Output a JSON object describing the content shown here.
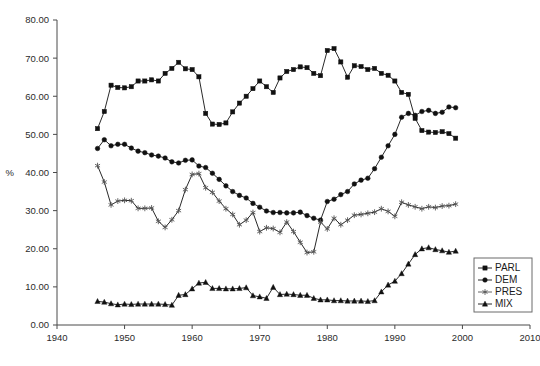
{
  "chart_data": {
    "type": "line",
    "title": "",
    "xlabel": "",
    "ylabel": "%",
    "xlim": [
      1940,
      2010
    ],
    "ylim": [
      0,
      80
    ],
    "xticks": [
      1940,
      1950,
      1960,
      1970,
      1980,
      1990,
      2000,
      2010
    ],
    "xtick_labels": [
      "1940",
      "1950",
      "1960",
      "1970",
      "1980",
      "1990",
      "2000",
      "2010"
    ],
    "yticks": [
      0,
      10,
      20,
      30,
      40,
      50,
      60,
      70,
      80
    ],
    "ytick_labels": [
      "0.00",
      "10.00",
      "20.00",
      "30.00",
      "40.00",
      "50.00",
      "60.00",
      "70.00",
      "80.00"
    ],
    "grid": false,
    "legend_position": "right-middle",
    "x": [
      1946,
      1947,
      1948,
      1949,
      1950,
      1951,
      1952,
      1953,
      1954,
      1955,
      1956,
      1957,
      1958,
      1959,
      1960,
      1961,
      1962,
      1963,
      1964,
      1965,
      1966,
      1967,
      1968,
      1969,
      1970,
      1971,
      1972,
      1973,
      1974,
      1975,
      1976,
      1977,
      1978,
      1979,
      1980,
      1981,
      1982,
      1983,
      1984,
      1985,
      1986,
      1987,
      1988,
      1989,
      1990,
      1991,
      1992,
      1993,
      1994,
      1995,
      1996,
      1997,
      1998,
      1999
    ],
    "series": [
      {
        "name": "PARL",
        "marker": "square",
        "color": "#111111",
        "values": [
          51.5,
          56.0,
          62.9,
          62.3,
          62.2,
          62.5,
          64.0,
          64.0,
          64.3,
          64.0,
          66.0,
          67.3,
          68.9,
          67.2,
          67.0,
          65.1,
          55.5,
          52.7,
          52.6,
          53.0,
          55.9,
          58.2,
          60.0,
          62.0,
          64.0,
          62.5,
          61.0,
          64.8,
          66.5,
          67.0,
          67.7,
          67.5,
          66.0,
          65.4,
          72.0,
          72.5,
          69.0,
          65.0,
          68.0,
          67.8,
          67.0,
          67.3,
          66.0,
          65.5,
          64.0,
          61.0,
          60.5,
          54.2,
          51.0,
          50.6,
          50.5,
          50.7,
          50.2,
          49.0
        ]
      },
      {
        "name": "DEM",
        "marker": "circle",
        "color": "#111111",
        "values": [
          46.3,
          48.6,
          47.0,
          47.4,
          47.4,
          46.4,
          45.6,
          45.2,
          44.6,
          44.3,
          43.8,
          42.8,
          42.5,
          43.2,
          43.3,
          41.7,
          41.3,
          39.8,
          38.2,
          36.5,
          35.0,
          34.0,
          33.3,
          31.9,
          30.9,
          29.9,
          29.5,
          29.5,
          29.4,
          29.4,
          29.6,
          28.7,
          28.0,
          27.5,
          32.4,
          33.0,
          34.2,
          35.0,
          37.0,
          38.0,
          38.5,
          41.0,
          44.0,
          47.0,
          50.0,
          54.5,
          55.5,
          55.0,
          56.0,
          56.3,
          55.5,
          55.8,
          57.2,
          57.0
        ]
      },
      {
        "name": "PRES",
        "marker": "star",
        "color": "#555555",
        "values": [
          41.8,
          37.5,
          31.5,
          32.5,
          32.7,
          32.6,
          30.6,
          30.6,
          30.7,
          27.2,
          25.6,
          27.6,
          30.0,
          35.5,
          39.5,
          39.7,
          36.0,
          34.8,
          32.5,
          30.5,
          29.0,
          26.3,
          27.5,
          29.5,
          24.5,
          25.5,
          25.3,
          24.3,
          27.0,
          24.5,
          21.7,
          19.0,
          19.2,
          27.0,
          25.2,
          28.0,
          26.3,
          27.5,
          28.8,
          29.0,
          29.3,
          29.6,
          30.5,
          29.8,
          28.5,
          32.2,
          31.5,
          31.0,
          30.5,
          31.0,
          30.8,
          31.2,
          31.3,
          31.7
        ]
      },
      {
        "name": "MIX",
        "marker": "triangle",
        "color": "#111111",
        "values": [
          6.2,
          6.0,
          5.6,
          5.3,
          5.5,
          5.4,
          5.5,
          5.5,
          5.5,
          5.5,
          5.4,
          5.2,
          7.8,
          8.0,
          9.5,
          11.0,
          11.2,
          9.6,
          9.6,
          9.5,
          9.5,
          9.6,
          9.8,
          7.7,
          7.4,
          7.0,
          9.9,
          8.0,
          8.1,
          8.0,
          7.8,
          7.8,
          7.0,
          6.6,
          6.6,
          6.4,
          6.4,
          6.3,
          6.3,
          6.3,
          6.2,
          6.4,
          8.7,
          10.5,
          11.5,
          13.5,
          16.0,
          18.5,
          20.0,
          20.3,
          19.8,
          19.5,
          19.1,
          19.4
        ]
      }
    ]
  },
  "legend": {
    "entries": [
      {
        "label": "PARL",
        "marker": "square"
      },
      {
        "label": "DEM",
        "marker": "circle"
      },
      {
        "label": "PRES",
        "marker": "star"
      },
      {
        "label": "MIX",
        "marker": "triangle"
      }
    ]
  },
  "axis": {
    "y_unit_label": "%"
  }
}
